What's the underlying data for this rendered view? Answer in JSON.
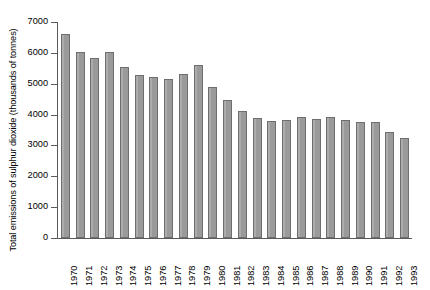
{
  "chart_data": {
    "type": "bar",
    "title": "",
    "subtitle": "",
    "xlabel": "",
    "ylabel": "Total emissions of sulphur dioxide (thousands of tonnes)",
    "categories": [
      "1970",
      "1971",
      "1972",
      "1973",
      "1974",
      "1975",
      "1976",
      "1977",
      "1978",
      "1979",
      "1980",
      "1981",
      "1982",
      "1983",
      "1984",
      "1985",
      "1986",
      "1987",
      "1988",
      "1989",
      "1990",
      "1991",
      "1992",
      "1993"
    ],
    "values": [
      6600,
      6030,
      5820,
      6030,
      5550,
      5270,
      5230,
      5140,
      5310,
      5620,
      4900,
      4470,
      4120,
      3900,
      3800,
      3820,
      3930,
      3850,
      3930,
      3830,
      3770,
      3760,
      3430,
      3240
    ],
    "ylim": [
      0,
      7000
    ],
    "yticks": [
      0,
      1000,
      2000,
      3000,
      4000,
      5000,
      6000,
      7000
    ],
    "ytick_labels": [
      "0",
      "1000",
      "2000",
      "3000",
      "4000",
      "5000",
      "6000",
      "7000"
    ],
    "grid": false,
    "legend": null,
    "legend_position": "none",
    "bar_color": "#9a9a9a",
    "bar_edge_color": "#6e6e6e",
    "axis_color": "#5a5a5a",
    "background_color": "#ffffff",
    "annotations": []
  }
}
